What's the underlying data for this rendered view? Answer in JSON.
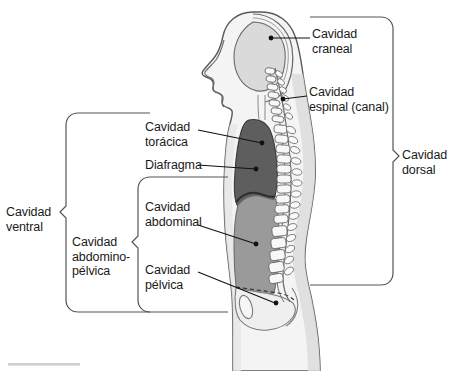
{
  "figure": {
    "language": "es",
    "colors": {
      "outline": "#4a4a4a",
      "body_fill": "#f2f2f2",
      "skin_shade": "#e3e3e3",
      "cranial_cavity": "#dcdcdc",
      "thoracic_cavity": "#5e5e5e",
      "abdominal_cavity": "#9a9a9a",
      "pelvic_cavity": "#efefef",
      "vertebra_fill": "#f7f7f7",
      "text": "#1a1a1a",
      "bracket": "#555555",
      "leader": "#111111",
      "footer_bar": "#cfcfcf"
    }
  },
  "labels": {
    "cranial": {
      "line1": "Cavidad",
      "line2": "craneal"
    },
    "spinal": {
      "line1": "Cavidad",
      "line2": "espinal (canal)"
    },
    "dorsal": {
      "line1": "Cavidad",
      "line2": "dorsal"
    },
    "thoracic": {
      "line1": "Cavidad",
      "line2": "torácica"
    },
    "diaphragm": {
      "line1": "Diafragma"
    },
    "abdominal": {
      "line1": "Cavidad",
      "line2": "abdominal"
    },
    "pelvic": {
      "line1": "Cavidad",
      "line2": "pélvica"
    },
    "ventral": {
      "line1": "Cavidad",
      "line2": "ventral"
    },
    "abdominopelvic": {
      "line1": "Cavidad",
      "line2": "abdomino-",
      "line3": "pélvica"
    }
  }
}
